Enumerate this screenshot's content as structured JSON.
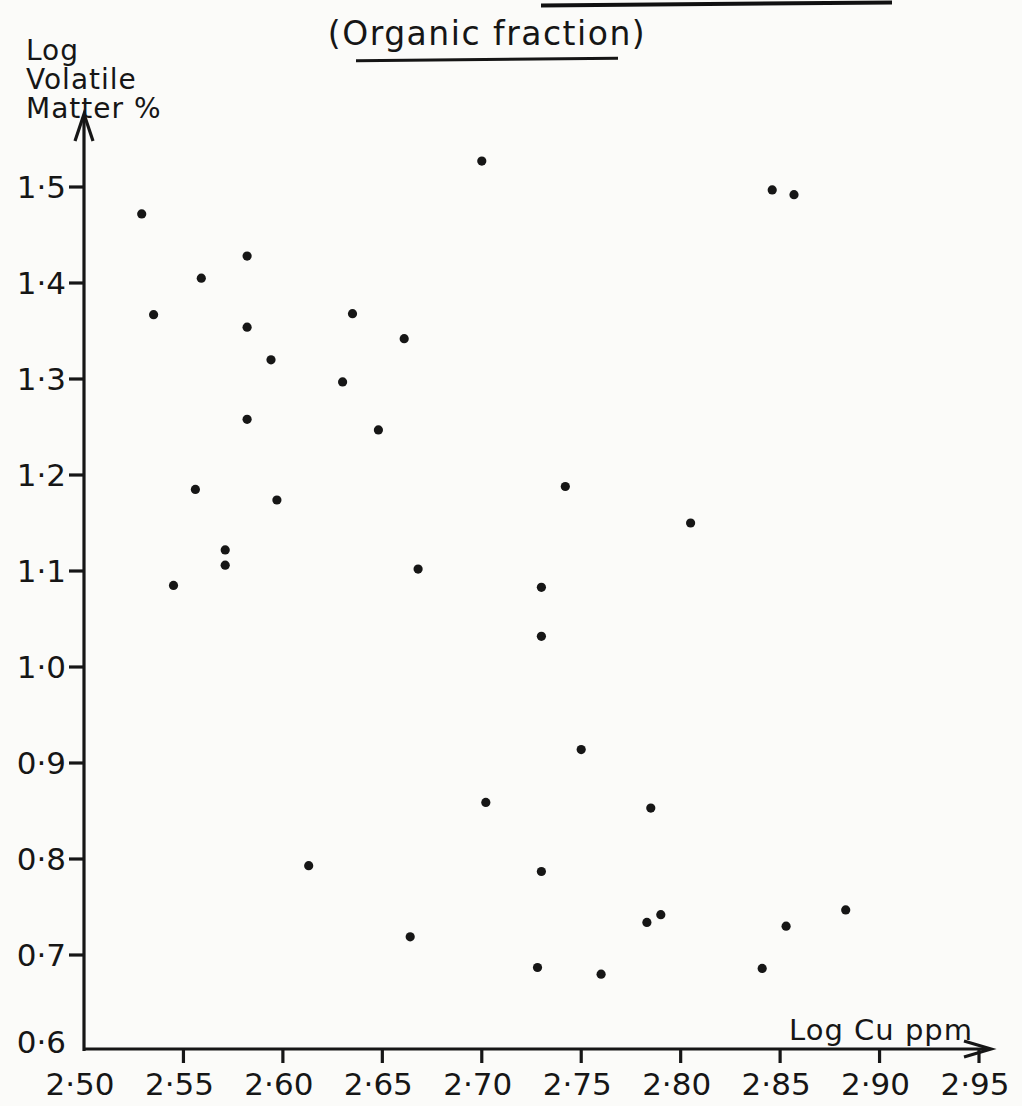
{
  "page": {
    "background": "#fbfbf9",
    "ink": "#161616",
    "note": "scanned book/paper figure; underline of a cropped-off heading visible at top right"
  },
  "chart_data": {
    "type": "scatter",
    "title": "(Organic fraction)",
    "title_underlined": true,
    "xlabel": "Log Cu ppm",
    "ylabel": "Log Volatile Matter %",
    "ylabel_lines": [
      "Log",
      "Volatile",
      "Matter %"
    ],
    "xlim": [
      2.5,
      2.95
    ],
    "ylim": [
      0.6,
      1.5
    ],
    "grid": false,
    "legend": null,
    "marker": "filled-dot",
    "decimal_separator": "middle-dot",
    "xticks": [
      {
        "v": 2.5,
        "label": "2·50"
      },
      {
        "v": 2.55,
        "label": "2·55"
      },
      {
        "v": 2.6,
        "label": "2·60"
      },
      {
        "v": 2.65,
        "label": "2·65"
      },
      {
        "v": 2.7,
        "label": "2·70"
      },
      {
        "v": 2.75,
        "label": "2·75"
      },
      {
        "v": 2.8,
        "label": "2·80"
      },
      {
        "v": 2.85,
        "label": "2·85"
      },
      {
        "v": 2.9,
        "label": "2·90"
      },
      {
        "v": 2.95,
        "label": "2·95"
      }
    ],
    "yticks": [
      {
        "v": 0.6,
        "label": "0·6"
      },
      {
        "v": 0.7,
        "label": "0·7"
      },
      {
        "v": 0.8,
        "label": "0·8"
      },
      {
        "v": 0.9,
        "label": "0·9"
      },
      {
        "v": 1.0,
        "label": "1·0"
      },
      {
        "v": 1.1,
        "label": "1·1"
      },
      {
        "v": 1.2,
        "label": "1·2"
      },
      {
        "v": 1.3,
        "label": "1·3"
      },
      {
        "v": 1.4,
        "label": "1·4"
      },
      {
        "v": 1.5,
        "label": "1·5"
      }
    ],
    "points": [
      [
        2.529,
        1.472
      ],
      [
        2.535,
        1.367
      ],
      [
        2.545,
        1.085
      ],
      [
        2.556,
        1.185
      ],
      [
        2.559,
        1.405
      ],
      [
        2.571,
        1.122
      ],
      [
        2.571,
        1.106
      ],
      [
        2.582,
        1.428
      ],
      [
        2.582,
        1.354
      ],
      [
        2.582,
        1.258
      ],
      [
        2.594,
        1.32
      ],
      [
        2.597,
        1.174
      ],
      [
        2.613,
        0.793
      ],
      [
        2.63,
        1.297
      ],
      [
        2.635,
        1.368
      ],
      [
        2.648,
        1.247
      ],
      [
        2.661,
        1.342
      ],
      [
        2.664,
        0.719
      ],
      [
        2.668,
        1.102
      ],
      [
        2.7,
        1.527
      ],
      [
        2.702,
        0.859
      ],
      [
        2.728,
        0.687
      ],
      [
        2.73,
        1.083
      ],
      [
        2.73,
        1.032
      ],
      [
        2.73,
        0.787
      ],
      [
        2.742,
        1.188
      ],
      [
        2.75,
        0.914
      ],
      [
        2.76,
        0.68
      ],
      [
        2.783,
        0.734
      ],
      [
        2.785,
        0.853
      ],
      [
        2.79,
        0.742
      ],
      [
        2.805,
        1.15
      ],
      [
        2.841,
        0.686
      ],
      [
        2.846,
        1.497
      ],
      [
        2.853,
        0.73
      ],
      [
        2.857,
        1.492
      ],
      [
        2.883,
        0.747
      ]
    ]
  }
}
